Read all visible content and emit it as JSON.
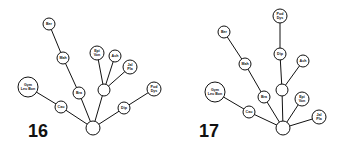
{
  "diagrams": [
    {
      "number": "16",
      "number_pos": [
        28,
        137
      ],
      "root": {
        "x": 93,
        "y": 128,
        "r": 7
      },
      "hub": {
        "x": 104,
        "y": 90,
        "r": 6
      },
      "nodes": [
        {
          "id": "ber",
          "lines": [
            "Ber"
          ],
          "x": 49,
          "y": 24,
          "r": 6
        },
        {
          "id": "mah",
          "lines": [
            "Mah"
          ],
          "x": 63,
          "y": 58,
          "r": 6
        },
        {
          "id": "bra",
          "lines": [
            "Bra"
          ],
          "x": 79,
          "y": 93,
          "r": 6
        },
        {
          "id": "gym",
          "lines": [
            "Gym",
            "Leu Bon"
          ],
          "x": 28,
          "y": 87,
          "r": 10
        },
        {
          "id": "cau",
          "lines": [
            "Cau"
          ],
          "x": 61,
          "y": 107,
          "r": 6
        },
        {
          "id": "epi",
          "lines": [
            "Epi",
            "Von"
          ],
          "x": 97,
          "y": 53,
          "r": 7
        },
        {
          "id": "ach",
          "lines": [
            "Ach"
          ],
          "x": 115,
          "y": 56,
          "r": 6
        },
        {
          "id": "jal",
          "lines": [
            "Jal",
            "Pla"
          ],
          "x": 130,
          "y": 67,
          "r": 7
        },
        {
          "id": "dip",
          "lines": [
            "Dip"
          ],
          "x": 124,
          "y": 108,
          "r": 6
        },
        {
          "id": "pod",
          "lines": [
            "Pod",
            "Dys"
          ],
          "x": 154,
          "y": 89,
          "r": 7
        }
      ],
      "edges": [
        [
          "root",
          "cau"
        ],
        [
          "cau",
          "gym"
        ],
        [
          "root",
          "bra"
        ],
        [
          "bra",
          "mah"
        ],
        [
          "mah",
          "ber"
        ],
        [
          "root",
          "hub"
        ],
        [
          "hub",
          "epi"
        ],
        [
          "hub",
          "ach"
        ],
        [
          "hub",
          "jal"
        ],
        [
          "root",
          "dip"
        ],
        [
          "dip",
          "pod"
        ]
      ]
    },
    {
      "number": "17",
      "number_pos": [
        199,
        137
      ],
      "root": {
        "x": 283,
        "y": 128,
        "r": 7
      },
      "hub": {
        "x": 282,
        "y": 90,
        "r": 6
      },
      "nodes": [
        {
          "id": "pod",
          "lines": [
            "Pod",
            "Dys"
          ],
          "x": 280,
          "y": 16,
          "r": 7
        },
        {
          "id": "dip",
          "lines": [
            "Dip"
          ],
          "x": 280,
          "y": 54,
          "r": 6
        },
        {
          "id": "ach",
          "lines": [
            "Ach"
          ],
          "x": 303,
          "y": 61,
          "r": 6
        },
        {
          "id": "ber",
          "lines": [
            "Ber"
          ],
          "x": 224,
          "y": 32,
          "r": 6
        },
        {
          "id": "mah",
          "lines": [
            "Mah"
          ],
          "x": 245,
          "y": 64,
          "r": 6
        },
        {
          "id": "gym",
          "lines": [
            "Gym",
            "Leu Bon"
          ],
          "x": 215,
          "y": 92,
          "r": 10
        },
        {
          "id": "bra",
          "lines": [
            "Bra"
          ],
          "x": 264,
          "y": 97,
          "r": 6
        },
        {
          "id": "epi",
          "lines": [
            "Epi",
            "Von"
          ],
          "x": 302,
          "y": 99,
          "r": 7
        },
        {
          "id": "cau",
          "lines": [
            "Cau"
          ],
          "x": 249,
          "y": 112,
          "r": 6
        },
        {
          "id": "jal",
          "lines": [
            "Jal",
            "Pla"
          ],
          "x": 319,
          "y": 117,
          "r": 7
        }
      ],
      "edges": [
        [
          "root",
          "cau"
        ],
        [
          "cau",
          "gym"
        ],
        [
          "root",
          "bra"
        ],
        [
          "bra",
          "mah"
        ],
        [
          "mah",
          "ber"
        ],
        [
          "root",
          "hub"
        ],
        [
          "hub",
          "dip"
        ],
        [
          "dip",
          "pod"
        ],
        [
          "hub",
          "ach"
        ],
        [
          "root",
          "epi"
        ],
        [
          "root",
          "jal"
        ]
      ]
    }
  ]
}
